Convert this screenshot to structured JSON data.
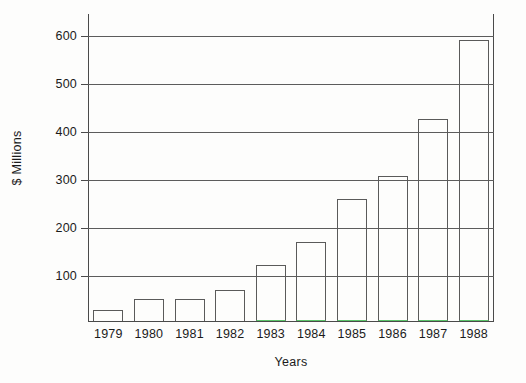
{
  "chart_data": {
    "type": "bar",
    "title": "",
    "subtitle": "",
    "xlabel": "Years",
    "ylabel": "$ Millions",
    "categories": [
      "1979",
      "1980",
      "1981",
      "1982",
      "1983",
      "1984",
      "1985",
      "1986",
      "1987",
      "1988"
    ],
    "values": [
      25,
      50,
      48,
      70,
      125,
      175,
      272,
      322,
      450,
      625
    ],
    "series": [
      {
        "name": "",
        "values": [
          25,
          50,
          48,
          70,
          125,
          175,
          272,
          322,
          450,
          625
        ]
      }
    ],
    "ylim": [
      0,
      650
    ],
    "yticks": [
      100,
      200,
      300,
      400,
      500,
      600
    ],
    "ytick_labels": [
      "100",
      "200",
      "300",
      "400",
      "500",
      "600"
    ],
    "xticks": [
      "1979",
      "1980",
      "1981",
      "1982",
      "1983",
      "1984",
      "1985",
      "1986",
      "1987",
      "1988"
    ],
    "grid": "horizontal",
    "legend": "none",
    "annotations": [],
    "colors": {
      "bar_outline": "#5a5a5a",
      "bar_fill": "transparent",
      "bar_foot_accent": "#5cc46a",
      "gridline": "#5c5c5c",
      "axis": "#4a4a4a",
      "text": "#1b1b1b",
      "background": "#fdfdfc"
    }
  }
}
